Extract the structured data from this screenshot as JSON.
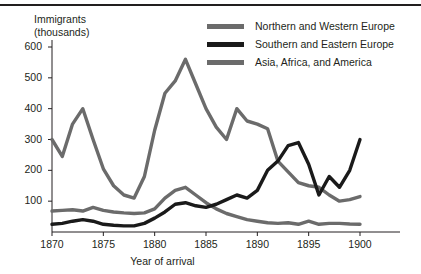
{
  "chart_data": {
    "type": "line",
    "title": "",
    "xlabel": "Year of arrival",
    "ylabel": "Immigrants (thousands)",
    "ylabel_line1": "Immigrants",
    "ylabel_line2": "(thousands)",
    "xlim": [
      1870,
      1900
    ],
    "ylim": [
      0,
      600
    ],
    "grid": false,
    "legend_position": "top-right",
    "xticks": [
      "1870",
      "1875",
      "1880",
      "1885",
      "1890",
      "1895",
      "1900"
    ],
    "xtick_values": [
      1870,
      1875,
      1880,
      1885,
      1890,
      1895,
      1900
    ],
    "yticks": [
      "100",
      "200",
      "300",
      "400",
      "500",
      "600"
    ],
    "ytick_values": [
      100,
      200,
      300,
      400,
      500,
      600
    ],
    "x": [
      1870,
      1871,
      1872,
      1873,
      1874,
      1875,
      1876,
      1877,
      1878,
      1879,
      1880,
      1881,
      1882,
      1883,
      1884,
      1885,
      1886,
      1887,
      1888,
      1889,
      1890,
      1891,
      1892,
      1893,
      1894,
      1895,
      1896,
      1897,
      1898,
      1899,
      1900
    ],
    "series": [
      {
        "name": "Northern and Western Europe",
        "color": "#6b6b6b",
        "values": [
          300,
          245,
          350,
          400,
          300,
          205,
          150,
          120,
          110,
          180,
          330,
          450,
          490,
          560,
          480,
          400,
          340,
          300,
          400,
          360,
          350,
          335,
          230,
          195,
          160,
          150,
          145,
          120,
          100,
          105,
          115
        ]
      },
      {
        "name": "Southern and Eastern Europe",
        "color": "#1a1a1a",
        "values": [
          25,
          28,
          35,
          40,
          35,
          25,
          22,
          20,
          20,
          28,
          45,
          65,
          90,
          95,
          85,
          80,
          90,
          105,
          120,
          110,
          135,
          200,
          230,
          280,
          290,
          220,
          120,
          180,
          145,
          200,
          300
        ]
      },
      {
        "name": "Asia, Africa, and America",
        "color": "#6b6b6b",
        "values": [
          68,
          70,
          72,
          68,
          80,
          70,
          65,
          62,
          60,
          62,
          75,
          110,
          135,
          145,
          120,
          95,
          75,
          60,
          50,
          40,
          35,
          30,
          28,
          30,
          25,
          35,
          25,
          28,
          28,
          26,
          25
        ]
      }
    ]
  },
  "legend": {
    "items": [
      {
        "label": "Northern and Western Europe",
        "color": "#6b6b6b"
      },
      {
        "label": "Southern and Eastern Europe",
        "color": "#1a1a1a"
      },
      {
        "label": "Asia, Africa, and America",
        "color": "#6b6b6b"
      }
    ]
  }
}
